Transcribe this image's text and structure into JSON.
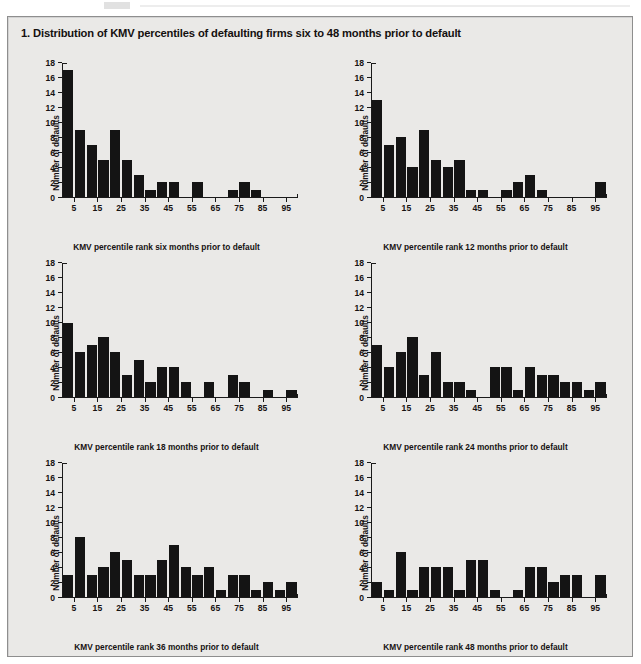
{
  "figure": {
    "title": "1. Distribution of KMV percentiles of defaulting firms six to 48 months prior to default",
    "background_color": "#eae9e7",
    "bar_color": "#141414",
    "border_color": "#8e8e8e"
  },
  "axes": {
    "ylabel": "Number of defaults",
    "yticks": [
      0,
      2,
      4,
      6,
      8,
      10,
      12,
      14,
      16,
      18
    ],
    "ylim": [
      0,
      18
    ],
    "xticks": [
      5,
      15,
      25,
      35,
      45,
      55,
      65,
      75,
      85,
      95
    ],
    "xlim": [
      0,
      100
    ],
    "bin_width": 5,
    "bin_midpoints": [
      2.5,
      7.5,
      12.5,
      17.5,
      22.5,
      27.5,
      32.5,
      37.5,
      42.5,
      47.5,
      52.5,
      57.5,
      62.5,
      67.5,
      72.5,
      77.5,
      82.5,
      87.5,
      92.5,
      97.5
    ]
  },
  "chart_data": [
    {
      "type": "bar",
      "panel": 1,
      "title": "",
      "xlabel": "KMV percentile rank six months prior to default",
      "ylabel": "Number of defaults",
      "ylim": [
        0,
        18
      ],
      "xlim": [
        0,
        100
      ],
      "grid": false,
      "legend": "none",
      "categories": [
        "0-5",
        "5-10",
        "10-15",
        "15-20",
        "20-25",
        "25-30",
        "30-35",
        "35-40",
        "40-45",
        "45-50",
        "50-55",
        "55-60",
        "60-65",
        "65-70",
        "70-75",
        "75-80",
        "80-85",
        "85-90",
        "90-95",
        "95-100"
      ],
      "values": [
        17,
        9,
        7,
        5,
        9,
        5,
        3,
        1,
        2,
        2,
        0,
        2,
        0,
        0,
        1,
        2,
        1,
        0,
        0,
        0
      ]
    },
    {
      "type": "bar",
      "panel": 2,
      "title": "",
      "xlabel": "KMV percentile rank 12 months prior to default",
      "ylabel": "Number of defaults",
      "ylim": [
        0,
        18
      ],
      "xlim": [
        0,
        100
      ],
      "grid": false,
      "legend": "none",
      "categories": [
        "0-5",
        "5-10",
        "10-15",
        "15-20",
        "20-25",
        "25-30",
        "30-35",
        "35-40",
        "40-45",
        "45-50",
        "50-55",
        "55-60",
        "60-65",
        "65-70",
        "70-75",
        "75-80",
        "80-85",
        "85-90",
        "90-95",
        "95-100"
      ],
      "values": [
        13,
        7,
        8,
        4,
        9,
        5,
        4,
        5,
        1,
        1,
        0,
        1,
        2,
        3,
        1,
        0,
        0,
        0,
        0,
        2
      ]
    },
    {
      "type": "bar",
      "panel": 3,
      "title": "",
      "xlabel": "KMV percentile rank 18 months prior to default",
      "ylabel": "Number of defaults",
      "ylim": [
        0,
        18
      ],
      "xlim": [
        0,
        100
      ],
      "grid": false,
      "legend": "none",
      "categories": [
        "0-5",
        "5-10",
        "10-15",
        "15-20",
        "20-25",
        "25-30",
        "30-35",
        "35-40",
        "40-45",
        "45-50",
        "50-55",
        "55-60",
        "60-65",
        "65-70",
        "70-75",
        "75-80",
        "80-85",
        "85-90",
        "90-95",
        "95-100"
      ],
      "values": [
        10,
        6,
        7,
        8,
        6,
        3,
        5,
        2,
        4,
        4,
        2,
        0,
        2,
        0,
        3,
        2,
        0,
        1,
        0,
        1
      ]
    },
    {
      "type": "bar",
      "panel": 4,
      "title": "",
      "xlabel": "KMV percentile rank 24 months prior to default",
      "ylabel": "Number of defaults",
      "ylim": [
        0,
        18
      ],
      "xlim": [
        0,
        100
      ],
      "grid": false,
      "legend": "none",
      "categories": [
        "0-5",
        "5-10",
        "10-15",
        "15-20",
        "20-25",
        "25-30",
        "30-35",
        "35-40",
        "40-45",
        "45-50",
        "50-55",
        "55-60",
        "60-65",
        "65-70",
        "70-75",
        "75-80",
        "80-85",
        "85-90",
        "90-95",
        "95-100"
      ],
      "values": [
        7,
        4,
        6,
        8,
        3,
        6,
        2,
        2,
        1,
        0,
        4,
        4,
        1,
        4,
        3,
        3,
        2,
        2,
        1,
        2
      ]
    },
    {
      "type": "bar",
      "panel": 5,
      "title": "",
      "xlabel": "KMV percentile rank 36 months prior to default",
      "ylabel": "Number of defaults",
      "ylim": [
        0,
        18
      ],
      "xlim": [
        0,
        100
      ],
      "grid": false,
      "legend": "none",
      "categories": [
        "0-5",
        "5-10",
        "10-15",
        "15-20",
        "20-25",
        "25-30",
        "30-35",
        "35-40",
        "40-45",
        "45-50",
        "50-55",
        "55-60",
        "60-65",
        "65-70",
        "70-75",
        "75-80",
        "80-85",
        "85-90",
        "90-95",
        "95-100"
      ],
      "values": [
        3,
        8,
        3,
        4,
        6,
        5,
        3,
        3,
        5,
        7,
        4,
        3,
        4,
        1,
        3,
        3,
        1,
        2,
        1,
        2
      ]
    },
    {
      "type": "bar",
      "panel": 6,
      "title": "",
      "xlabel": "KMV percentile rank 48 months prior to default",
      "ylabel": "Number of defaults",
      "ylim": [
        0,
        18
      ],
      "xlim": [
        0,
        100
      ],
      "grid": false,
      "legend": "none",
      "categories": [
        "0-5",
        "5-10",
        "10-15",
        "15-20",
        "20-25",
        "25-30",
        "30-35",
        "35-40",
        "40-45",
        "45-50",
        "50-55",
        "55-60",
        "60-65",
        "65-70",
        "70-75",
        "75-80",
        "80-85",
        "85-90",
        "90-95",
        "95-100"
      ],
      "values": [
        2,
        1,
        6,
        1,
        4,
        4,
        4,
        1,
        5,
        5,
        1,
        0,
        1,
        4,
        4,
        2,
        3,
        3,
        0,
        3
      ]
    }
  ]
}
